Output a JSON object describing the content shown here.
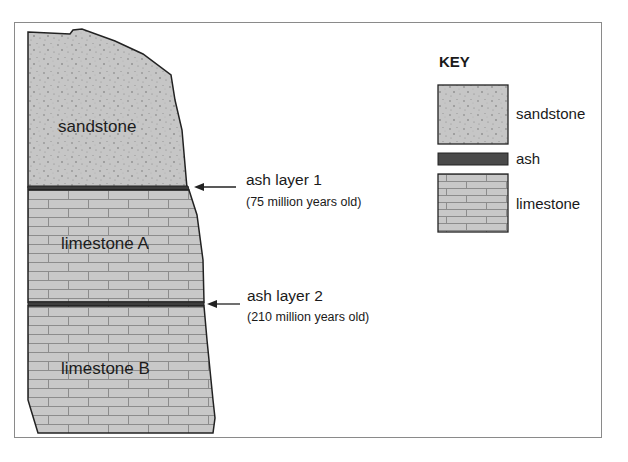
{
  "diagram": {
    "type": "geologic-cross-section",
    "layers": [
      {
        "name": "sandstone",
        "label": "sandstone",
        "position": "top"
      },
      {
        "name": "ash-layer-1",
        "label": "ash layer 1",
        "age": "(75 million years old)"
      },
      {
        "name": "limestone-a",
        "label": "limestone A",
        "position": "middle"
      },
      {
        "name": "ash-layer-2",
        "label": "ash layer 2",
        "age": "(210 million years old)"
      },
      {
        "name": "limestone-b",
        "label": "limestone B",
        "position": "bottom"
      }
    ],
    "key": {
      "title": "KEY",
      "items": [
        {
          "label": "sandstone",
          "pattern": "stipple"
        },
        {
          "label": "ash",
          "pattern": "dark-solid"
        },
        {
          "label": "limestone",
          "pattern": "brick"
        }
      ]
    },
    "colors": {
      "rock_fill": "#c8c8c8",
      "ash_fill": "#4a4a4a",
      "outline": "#222222",
      "frame": "#8a8a8a"
    }
  }
}
